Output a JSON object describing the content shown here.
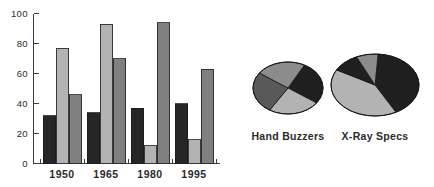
{
  "chart_data": [
    {
      "type": "bar",
      "title": "",
      "subtitle": "",
      "xlabel": "",
      "ylabel": "",
      "categories": [
        "1950",
        "1965",
        "1980",
        "1995"
      ],
      "series": [
        {
          "name": "series-1",
          "color": "#262626",
          "values": [
            32,
            34,
            37,
            40
          ]
        },
        {
          "name": "series-2",
          "color": "#b3b3b3",
          "values": [
            77,
            93,
            12,
            16
          ]
        },
        {
          "name": "series-3",
          "color": "#808080",
          "values": [
            46,
            70,
            94,
            63
          ]
        }
      ],
      "ylim": [
        0,
        100
      ],
      "yticks": [
        0,
        20,
        40,
        60,
        80,
        100
      ],
      "ytick_labels": [
        "0",
        "20",
        "40",
        "60",
        "80",
        "100"
      ],
      "grid": false,
      "legend": "none"
    },
    {
      "type": "pie",
      "title": "Hand Buzzers",
      "labels": [
        "slice-a",
        "slice-b",
        "slice-c",
        "slice-d"
      ],
      "values": [
        27,
        24,
        26,
        23
      ],
      "colors": [
        "#1f1f1f",
        "#b3b3b3",
        "#595959",
        "#8c8c8c"
      ],
      "start_angle": 0,
      "legend": "none"
    },
    {
      "type": "pie",
      "title": "X-Ray Specs",
      "labels": [
        "slice-a",
        "slice-b",
        "slice-c",
        "slice-d"
      ],
      "values": [
        41,
        41,
        10,
        8
      ],
      "colors": [
        "#1f1f1f",
        "#b3b3b3",
        "#1f1f1f",
        "#8c8c8c"
      ],
      "start_angle": 0,
      "legend": "none"
    }
  ],
  "bar_chart": {
    "axis": {
      "ytick_labels": [
        "100",
        "80",
        "60",
        "40",
        "20",
        "0"
      ],
      "xtick_labels": [
        "1950",
        "1965",
        "1980",
        "1995"
      ]
    }
  },
  "pies": {
    "items": [
      {
        "caption": "Hand Buzzers"
      },
      {
        "caption": "X-Ray Specs"
      }
    ]
  }
}
